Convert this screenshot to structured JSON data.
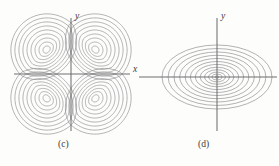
{
  "figure": {
    "background_color": "#fdfdfc",
    "stroke_color": "#8a8a8a",
    "axis_color": "#6f6f6f",
    "label_color": "#3b3b3b"
  },
  "panels": [
    {
      "id": "c",
      "caption": "(c)",
      "axis_labels": {
        "x": "x",
        "y": "y"
      },
      "contour_count_per_lobe": 9,
      "lobe_count": 4
    },
    {
      "id": "d",
      "caption": "(d)",
      "axis_labels": {
        "x": "x",
        "y": "y"
      },
      "contour_count": 12,
      "lobe_count": 1
    }
  ],
  "chart_data": [
    {
      "type": "line",
      "subtype": "contour",
      "title": "(c)",
      "xlabel": "x",
      "ylabel": "y",
      "grid": false,
      "legend": null,
      "xlim": [
        -1.15,
        1.15
      ],
      "ylim": [
        -1.15,
        1.15
      ],
      "description": "Contour map of a quadrupole / saddle function with four teardrop lobes, one per quadrant, each lobe a nest of closed level curves converging on an extremum; the curves point toward the origin where the axes cross.",
      "levels": [
        0.1,
        0.2,
        0.3,
        0.4,
        0.5,
        0.6,
        0.7,
        0.8,
        0.9
      ],
      "lobes": [
        {
          "quadrant": "I",
          "center": [
            0.46,
            0.46
          ],
          "sign": "+"
        },
        {
          "quadrant": "II",
          "center": [
            -0.46,
            0.46
          ],
          "sign": "-"
        },
        {
          "quadrant": "III",
          "center": [
            -0.46,
            -0.46
          ],
          "sign": "+"
        },
        {
          "quadrant": "IV",
          "center": [
            0.46,
            -0.46
          ],
          "sign": "-"
        }
      ],
      "axes": {
        "x_drawn": true,
        "y_drawn": true,
        "origin": [
          0,
          0
        ]
      }
    },
    {
      "type": "line",
      "subtype": "contour",
      "title": "(d)",
      "xlabel": "x",
      "ylabel": "y",
      "grid": false,
      "legend": null,
      "xlim": [
        -1.15,
        1.15
      ],
      "ylim": [
        -1.15,
        1.15
      ],
      "description": "Contour map of a single elliptic extremum: twelve concentric ellipses centered on the origin, wider in x than in y, spacing decreasing toward the center.",
      "levels": [
        0.05,
        0.12,
        0.2,
        0.29,
        0.38,
        0.47,
        0.56,
        0.65,
        0.73,
        0.81,
        0.89,
        0.96
      ],
      "center": [
        0,
        0
      ],
      "aspect_ratio_x_over_y": 1.72,
      "axes": {
        "x_drawn": true,
        "y_drawn": true,
        "origin": [
          0,
          0
        ]
      }
    }
  ]
}
